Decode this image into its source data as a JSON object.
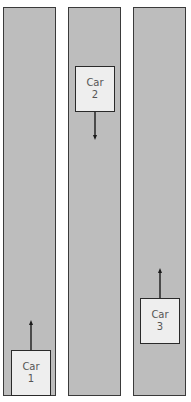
{
  "lanes": [
    {
      "id": "lane-1"
    },
    {
      "id": "lane-2"
    },
    {
      "id": "lane-3"
    }
  ],
  "cars": [
    {
      "label_line1": "Car",
      "label_line2": "1",
      "lane": 1,
      "direction": "up"
    },
    {
      "label_line1": "Car",
      "label_line2": "2",
      "lane": 2,
      "direction": "down"
    },
    {
      "label_line1": "Car",
      "label_line2": "3",
      "lane": 3,
      "direction": "up"
    }
  ],
  "colors": {
    "lane_fill": "#bdbdbd",
    "car_fill": "#eeeeee",
    "stroke": "#2a2a2a"
  }
}
